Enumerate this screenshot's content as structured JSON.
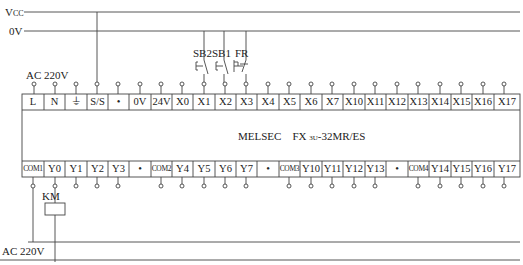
{
  "diagram": {
    "rails": {
      "vcc_label": "V",
      "vcc_sub": "CC",
      "zero_v_label": "0V",
      "ac_top_label": "AC 220V",
      "ac_bottom_label": "AC 220V"
    },
    "switches": [
      {
        "label": "SB2",
        "type": "normally-open pushbutton",
        "connects_to": "X0"
      },
      {
        "label": "SB1",
        "type": "normally-open pushbutton",
        "connects_to": "X1"
      },
      {
        "label": "FR",
        "type": "thermal overload normally-closed contact",
        "connects_to": "X2"
      }
    ],
    "plc": {
      "model_brand": "MELSEC",
      "model_prefix": "FX",
      "model_sub": "3U",
      "model_suffix": "-32MR/ES",
      "top_terminals": [
        "L",
        "N",
        "⏚",
        "S/S",
        "•",
        "0V",
        "24V",
        "X0",
        "X1",
        "X2",
        "X3",
        "X4",
        "X5",
        "X6",
        "X7",
        "X10",
        "X11",
        "X12",
        "X13",
        "X14",
        "X15",
        "X16",
        "X17"
      ],
      "bottom_terminals": [
        "COM1",
        "Y0",
        "Y1",
        "Y2",
        "Y3",
        "•",
        "COM2",
        "Y4",
        "Y5",
        "Y6",
        "Y7",
        "•",
        "COM3",
        "Y10",
        "Y11",
        "Y12",
        "Y13",
        "•",
        "COM4",
        "Y14",
        "Y15",
        "Y16",
        "Y17"
      ]
    },
    "coil": {
      "label": "KM",
      "connects_to": "Y0"
    }
  }
}
